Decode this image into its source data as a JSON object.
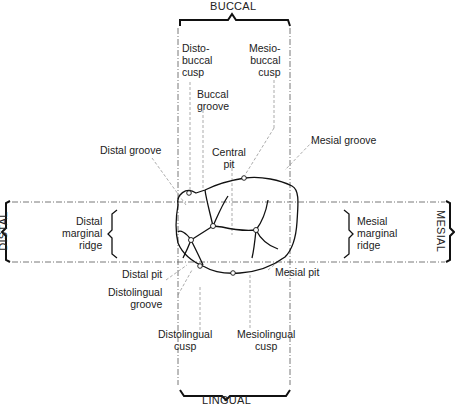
{
  "directions": {
    "top": "BUCCAL",
    "bottom": "LINGUAL",
    "left": "DISTAL",
    "right": "MESIAL"
  },
  "labels": {
    "distobuccal_cusp": [
      "Disto-",
      "buccal",
      "cusp"
    ],
    "mesiobuccal_cusp": [
      "Mesio-",
      "buccal",
      "cusp"
    ],
    "buccal_groove": [
      "Buccal",
      "groove"
    ],
    "distal_groove": "Distal groove",
    "central_pit": [
      "Central",
      "pit"
    ],
    "mesial_groove": "Mesial groove",
    "distal_marginal_ridge": [
      "Distal",
      "marginal",
      "ridge"
    ],
    "mesial_marginal_ridge": [
      "Mesial",
      "marginal",
      "ridge"
    ],
    "distal_pit": "Distal pit",
    "distolingual_groove": [
      "Distolingual",
      "groove"
    ],
    "mesial_pit": "Mesial pit",
    "distolingual_cusp": [
      "Distolingual",
      "cusp"
    ],
    "mesiolingual_cusp": [
      "Mesiolingual",
      "cusp"
    ]
  }
}
